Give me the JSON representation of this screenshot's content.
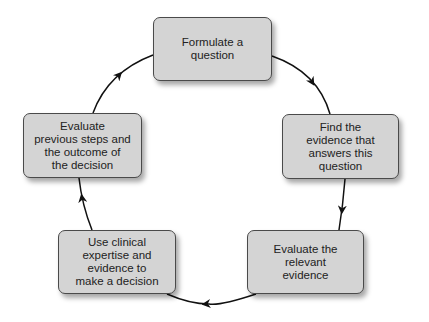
{
  "diagram": {
    "type": "cycle",
    "steps": [
      {
        "id": "formulate",
        "label": "Formulate a\nquestion"
      },
      {
        "id": "find",
        "label": "Find the\nevidence that\nanswers this\nquestion"
      },
      {
        "id": "evaluate-evidence",
        "label": "Evaluate the\nrelevant\nevidence"
      },
      {
        "id": "decide",
        "label": "Use clinical\nexpertise and\nevidence to\nmake a decision"
      },
      {
        "id": "evaluate-outcome",
        "label": "Evaluate\nprevious steps and\nthe outcome of\nthe decision"
      }
    ],
    "edges": [
      {
        "from": "formulate",
        "to": "find"
      },
      {
        "from": "find",
        "to": "evaluate-evidence"
      },
      {
        "from": "evaluate-evidence",
        "to": "decide"
      },
      {
        "from": "decide",
        "to": "evaluate-outcome"
      },
      {
        "from": "evaluate-outcome",
        "to": "formulate"
      }
    ],
    "colors": {
      "box_fill": "#d4d4d4",
      "box_border": "#4a4a4a",
      "arrow": "#111111"
    }
  }
}
